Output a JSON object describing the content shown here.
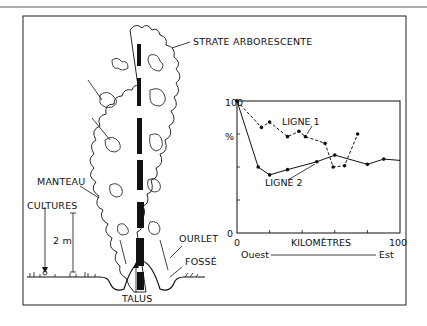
{
  "figure": {
    "labels": {
      "canopy": "STRATE ARBORESCENTE",
      "mantle": "MANTEAU",
      "crops": "CULTURES",
      "height_scale": "2 m",
      "fringe": "OURLET",
      "ditch": "FOSSÉ",
      "bank": "TALUS"
    }
  },
  "chart_data": {
    "type": "line",
    "title": "",
    "xlabel": "KILOMÈTRES",
    "x_direction": {
      "left": "Ouest",
      "right": "Est"
    },
    "ylabel": "%",
    "xlim": [
      0,
      100
    ],
    "ylim": [
      0,
      100
    ],
    "x_tick_labels": [
      "0",
      "100"
    ],
    "y_tick_labels": [
      "0",
      "100"
    ],
    "grid": false,
    "series": [
      {
        "name": "LIGNE 1",
        "style": "dashed",
        "x": [
          0,
          15,
          20,
          31,
          38,
          42,
          54,
          59,
          66,
          74
        ],
        "y": [
          100,
          80,
          84,
          73,
          77,
          73,
          68,
          50,
          51,
          75
        ]
      },
      {
        "name": "LIGNE 2",
        "style": "solid",
        "x": [
          0,
          13,
          20,
          31,
          49,
          60,
          80,
          90,
          100
        ],
        "y": [
          100,
          50,
          44,
          48,
          54,
          59,
          52,
          56,
          55
        ]
      }
    ]
  }
}
